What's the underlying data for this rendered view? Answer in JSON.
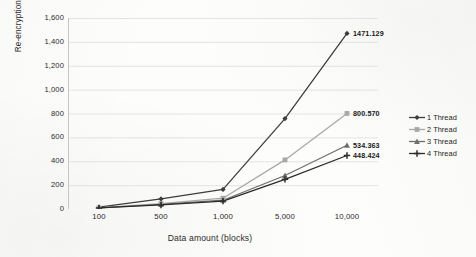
{
  "chart_data": {
    "type": "line",
    "title": "",
    "xlabel": "Data amount (blocks)",
    "ylabel": "Re-encryption time",
    "categories": [
      "100",
      "500",
      "1,000",
      "5,000",
      "10,000"
    ],
    "ylim": [
      0,
      1600
    ],
    "yticks": [
      "0",
      "200",
      "400",
      "600",
      "800",
      "1,000",
      "1,200",
      "1,400",
      "1,600"
    ],
    "grid": "horizontal",
    "legend_position": "right",
    "series": [
      {
        "name": "1 Thread",
        "color": "#3c3c3c",
        "marker": "diamond",
        "values": [
          14.8,
          84.5,
          163.9,
          757.2,
          1471.129
        ],
        "end_label": "1471.129"
      },
      {
        "name": "2 Thread",
        "color": "#a8a8a8",
        "marker": "square",
        "values": [
          10.2,
          46.0,
          90.5,
          411.3,
          800.57
        ],
        "end_label": "800.570"
      },
      {
        "name": "3 Thread",
        "color": "#6e6e6e",
        "marker": "triangle",
        "values": [
          9.0,
          38.5,
          73.6,
          281.0,
          534.363
        ],
        "end_label": "534.363"
      },
      {
        "name": "4 Thread",
        "color": "#2b2b2b",
        "marker": "cross",
        "values": [
          8.4,
          34.0,
          66.2,
          248.5,
          448.424
        ],
        "end_label": "448.424"
      }
    ]
  },
  "legend": {
    "items": [
      {
        "label": "1 Thread"
      },
      {
        "label": "2 Thread"
      },
      {
        "label": "3 Thread"
      },
      {
        "label": "4 Thread"
      }
    ]
  },
  "colors": {
    "background": "#fdfdfc",
    "gridline": "#d9d9d9",
    "axis": "#bfbfbf",
    "text": "#2d2a28"
  }
}
